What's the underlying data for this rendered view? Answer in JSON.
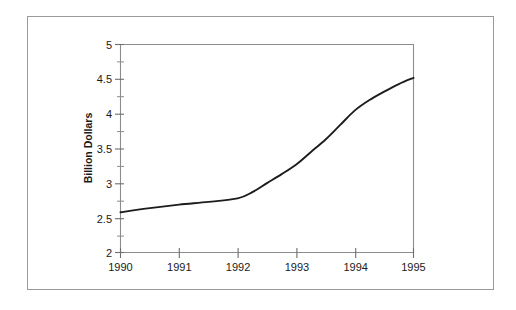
{
  "figure": {
    "background_color": "#ffffff",
    "border_color": "#9a9a9a",
    "line_color": "#1c1c1c"
  },
  "chart_data": {
    "type": "line",
    "title": "",
    "xlabel": "",
    "ylabel": "Billion Dollars",
    "xlim": [
      1990,
      1995
    ],
    "ylim": [
      2,
      5
    ],
    "grid": false,
    "legend": false,
    "x_tick_labels": [
      "1990",
      "1991",
      "1992",
      "1993",
      "1994",
      "1995"
    ],
    "x_ticks": [
      1990,
      1991,
      1992,
      1993,
      1994,
      1995
    ],
    "y_tick_labels": [
      "2",
      "2.5",
      "3",
      "3.5",
      "4",
      "4.5",
      "5"
    ],
    "y_ticks": [
      2,
      2.5,
      3,
      3.5,
      4,
      4.5,
      5
    ],
    "y_minor_ticks": [
      2.25,
      2.75,
      3.25,
      3.75,
      4.25,
      4.75
    ],
    "series": [
      {
        "name": "Billion Dollars",
        "x": [
          1990,
          1990.5,
          1991,
          1991.5,
          1992,
          1992.25,
          1992.5,
          1992.75,
          1993,
          1993.25,
          1993.5,
          1993.75,
          1994,
          1994.25,
          1994.5,
          1994.75,
          1995
        ],
        "values": [
          2.58,
          2.64,
          2.69,
          2.73,
          2.78,
          2.87,
          3.0,
          3.13,
          3.27,
          3.45,
          3.63,
          3.84,
          4.05,
          4.2,
          4.32,
          4.43,
          4.52
        ]
      }
    ]
  }
}
